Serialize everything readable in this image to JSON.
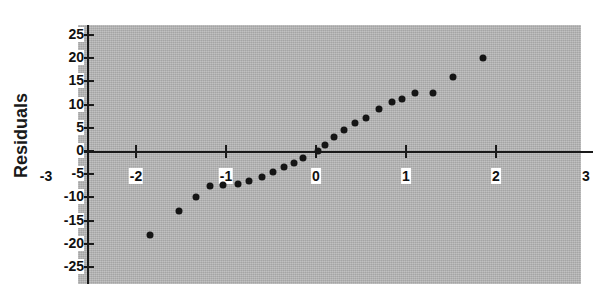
{
  "chart_data": {
    "type": "scatter",
    "title": "",
    "subtitle": "",
    "xlabel": "",
    "ylabel": "Residuals",
    "xlim": [
      -3,
      3
    ],
    "ylim": [
      -25,
      25
    ],
    "x_ticks": [
      -3,
      -2,
      -1,
      0,
      1,
      2,
      3
    ],
    "x_tick_labels": [
      "-3",
      "-2",
      "-1",
      "0",
      "1",
      "2",
      "3"
    ],
    "y_ticks": [
      -25,
      -20,
      -15,
      -10,
      -5,
      0,
      5,
      10,
      15,
      20,
      25
    ],
    "y_tick_labels": [
      "-25",
      "-20",
      "-15",
      "-10",
      "-5",
      "0",
      "5",
      "10",
      "15",
      "20",
      "25"
    ],
    "grid": false,
    "legend": false,
    "legend_position": "none",
    "series": [
      {
        "name": "Residuals",
        "marker": "circle",
        "marker_color": "#151515",
        "points": [
          [
            -1.85,
            -18.0
          ],
          [
            -1.52,
            -13.0
          ],
          [
            -1.33,
            -10.0
          ],
          [
            -1.18,
            -7.5
          ],
          [
            -1.03,
            -7.3
          ],
          [
            -0.87,
            -7.2
          ],
          [
            -0.74,
            -6.5
          ],
          [
            -0.6,
            -5.5
          ],
          [
            -0.48,
            -4.5
          ],
          [
            -0.36,
            -3.5
          ],
          [
            -0.25,
            -2.6
          ],
          [
            -0.14,
            -1.6
          ],
          [
            0.02,
            0.0
          ],
          [
            0.1,
            1.2
          ],
          [
            0.2,
            3.0
          ],
          [
            0.31,
            4.5
          ],
          [
            0.43,
            6.0
          ],
          [
            0.56,
            7.2
          ],
          [
            0.7,
            9.0
          ],
          [
            0.84,
            10.5
          ],
          [
            0.96,
            11.2
          ],
          [
            1.1,
            12.6
          ],
          [
            1.3,
            12.6
          ],
          [
            1.52,
            16.0
          ],
          [
            1.85,
            20.0
          ]
        ]
      }
    ],
    "panel_color": "#b4b4b4",
    "background_color": "#ffffff",
    "axis_color": "#1a1a1a"
  }
}
